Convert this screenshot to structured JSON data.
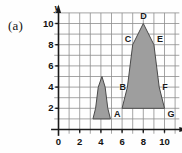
{
  "panel": {
    "label": "(a)"
  },
  "axes": {
    "x_name": "x",
    "y_name": "y",
    "origin_label": "0",
    "x_ticks": [
      "2",
      "4",
      "6",
      "8",
      "10"
    ],
    "y_ticks": [
      "2",
      "4",
      "6",
      "8",
      "10"
    ]
  },
  "vertex_labels": {
    "A": "A",
    "B": "B",
    "C": "C",
    "D": "D",
    "E": "E",
    "F": "F",
    "G": "G"
  },
  "colors": {
    "fill": "#9e9e9e",
    "stroke": "#4a4a4a",
    "grid": "#8d8d8d",
    "axis": "#1a1a1a",
    "text": "#121212",
    "background": "#fefefe"
  },
  "chart_data": {
    "type": "scatter",
    "title": "",
    "xlabel": "x",
    "ylabel": "y",
    "xlim": [
      0,
      11
    ],
    "ylim": [
      0,
      11
    ],
    "xticks": [
      0,
      2,
      4,
      6,
      8,
      10
    ],
    "yticks": [
      2,
      4,
      6,
      8,
      10
    ],
    "grid": true,
    "grid_spacing": 1,
    "legend": "none",
    "shapes": [
      {
        "name": "large-rocket",
        "labelled": true,
        "vertices": [
          {
            "label": "A",
            "x": 6,
            "y": 2
          },
          {
            "label": "B",
            "x": 6.5,
            "y": 4
          },
          {
            "label": "C",
            "x": 7,
            "y": 8
          },
          {
            "label": "D",
            "x": 8,
            "y": 10
          },
          {
            "label": "E",
            "x": 9,
            "y": 8
          },
          {
            "label": "F",
            "x": 9.5,
            "y": 4
          },
          {
            "label": "G",
            "x": 10,
            "y": 2
          }
        ]
      },
      {
        "name": "small-rocket",
        "labelled": false,
        "vertices": [
          {
            "label": "",
            "x": 3.25,
            "y": 1
          },
          {
            "label": "",
            "x": 3.5,
            "y": 2
          },
          {
            "label": "",
            "x": 3.75,
            "y": 4
          },
          {
            "label": "",
            "x": 4.1,
            "y": 5
          },
          {
            "label": "",
            "x": 4.4,
            "y": 4
          },
          {
            "label": "",
            "x": 4.65,
            "y": 2
          },
          {
            "label": "",
            "x": 4.9,
            "y": 1
          }
        ]
      }
    ]
  }
}
